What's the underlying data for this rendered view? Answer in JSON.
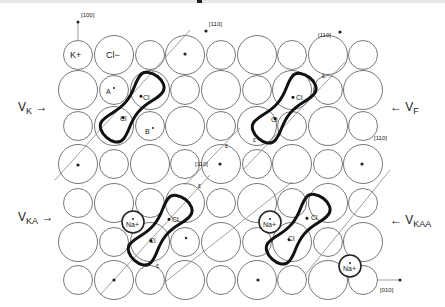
{
  "diagram": {
    "ions": {
      "cation_label": "K+",
      "anion_label": "Cl−",
      "impurity_label": "Na+"
    },
    "directions": {
      "d100": "[100]",
      "d110": "[110]",
      "d010": "[010]"
    },
    "center_labels": {
      "vk": "V",
      "vk_sub": "K",
      "vf": "V",
      "vf_sub": "F",
      "vka": "V",
      "vka_sub": "KA",
      "vkaa": "V",
      "vkaa_sub": "KAA"
    },
    "site_labels": {
      "a": "A",
      "b": "B",
      "cl": "Cl",
      "epsilon": "ε"
    },
    "lattice": {
      "columns": 9,
      "rows": 7,
      "small_radius": 14.5,
      "large_radius": 19.5,
      "line_color": "#555555",
      "molecule_color": "#111111"
    }
  }
}
